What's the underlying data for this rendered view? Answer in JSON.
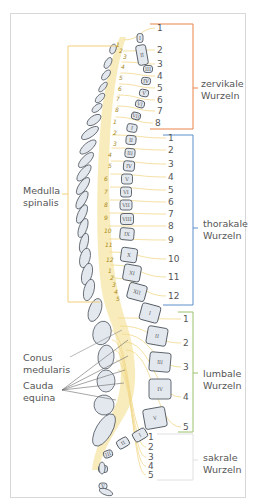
{
  "labels": {
    "medulla": [
      "Medulla",
      "spinalis"
    ],
    "conus": [
      "Conus",
      "medularis"
    ],
    "cauda": [
      "Cauda",
      "equina"
    ]
  },
  "groups": [
    {
      "id": "cervical",
      "label": [
        "zervikale",
        "Wurzeln"
      ],
      "color": "#e8834a",
      "numbers": [
        "1",
        "2",
        "3",
        "4",
        "5",
        "6",
        "7",
        "8"
      ]
    },
    {
      "id": "thoracic",
      "label": [
        "thorakale",
        "Wurzeln"
      ],
      "color": "#5a8fc9",
      "numbers": [
        "1",
        "2",
        "3",
        "4",
        "5",
        "6",
        "7",
        "8",
        "9",
        "10",
        "11",
        "12"
      ]
    },
    {
      "id": "lumbar",
      "label": [
        "lumbale",
        "Wurzeln"
      ],
      "color": "#9cc06a",
      "numbers": [
        "1",
        "2",
        "3",
        "4",
        "5"
      ]
    },
    {
      "id": "sacral",
      "label": [
        "sakrale",
        "Wurzeln"
      ],
      "color": "#e0e0e0",
      "numbers": [
        "1",
        "2",
        "3",
        "4",
        "5"
      ]
    }
  ],
  "vertebrae": {
    "cervical": [
      "I",
      "II",
      "III",
      "IV",
      "V",
      "VI",
      "VII"
    ],
    "thoracic": [
      "I",
      "II",
      "III",
      "IV",
      "V",
      "VI",
      "VII",
      "VIII",
      "IX",
      "X",
      "XI",
      "XII"
    ],
    "lumbar": [
      "I",
      "II",
      "III",
      "IV",
      "V"
    ],
    "sacral": [
      "I",
      "II",
      "III",
      "IV",
      "V"
    ]
  },
  "cord_segments": {
    "cervical": [
      "1",
      "2",
      "3",
      "4",
      "5",
      "6",
      "7",
      "8"
    ],
    "thoracic": [
      "1",
      "2",
      "3",
      "4",
      "5",
      "6",
      "7",
      "8",
      "9",
      "10",
      "11",
      "12"
    ],
    "lumbar": [
      "1",
      "2",
      "3",
      "4",
      "5"
    ]
  },
  "colors": {
    "cord": "#f7e9b0",
    "root": "#f1d88a",
    "vertebra_fill": "#e3e8ef",
    "vertebra_stroke": "#3f4650",
    "medulla_bracket": "#f3cf7a"
  }
}
